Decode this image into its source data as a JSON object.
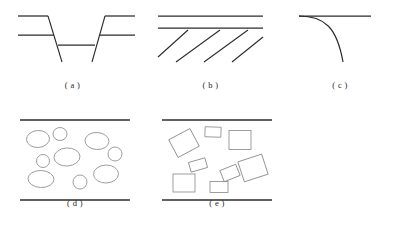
{
  "figure": {
    "width": 399,
    "height": 226,
    "background": "#ffffff",
    "line_color": "#2b2b2b",
    "clast_color": "#8d8d8d"
  },
  "panels": [
    {
      "id": "a",
      "caption": "( a )",
      "name": "graben-normal-fault-panel",
      "description": "Graben bounded by inward-dipping normal faults offsetting two marker beds",
      "beds": [
        {
          "name": "upper-bed-left",
          "x1": 18,
          "y1": 14,
          "x2": 48,
          "y2": 14
        },
        {
          "name": "upper-bed-right",
          "x1": 105,
          "y1": 14,
          "x2": 135,
          "y2": 14
        },
        {
          "name": "middle-bed-left",
          "x1": 18,
          "y1": 33,
          "x2": 54,
          "y2": 33
        },
        {
          "name": "middle-bed-right",
          "x1": 100,
          "y1": 33,
          "x2": 135,
          "y2": 33
        },
        {
          "name": "downthrown-bed",
          "x1": 58,
          "y1": 43,
          "x2": 95,
          "y2": 43
        }
      ],
      "faults": [
        {
          "name": "left-normal-fault",
          "x1": 48,
          "y1": 14,
          "x2": 62,
          "y2": 60
        },
        {
          "name": "right-normal-fault",
          "x1": 105,
          "y1": 14,
          "x2": 92,
          "y2": 60
        }
      ]
    },
    {
      "id": "b",
      "caption": "( b )",
      "name": "parallel-shear-fracture-panel",
      "description": "Two horizontal bedding planes above a set of parallel inclined shear fractures",
      "beds": [
        {
          "name": "upper-bedding-plane",
          "x1": 10,
          "y1": 14,
          "x2": 115,
          "y2": 14
        },
        {
          "name": "lower-bedding-plane",
          "x1": 10,
          "y1": 26,
          "x2": 115,
          "y2": 26
        }
      ],
      "fractures": [
        {
          "name": "shear-fracture-1",
          "x1": 10,
          "y1": 55,
          "x2": 40,
          "y2": 28
        },
        {
          "name": "shear-fracture-2",
          "x1": 28,
          "y1": 60,
          "x2": 72,
          "y2": 28
        },
        {
          "name": "shear-fracture-3",
          "x1": 56,
          "y1": 60,
          "x2": 100,
          "y2": 28
        },
        {
          "name": "shear-fracture-4",
          "x1": 84,
          "y1": 60,
          "x2": 115,
          "y2": 35
        }
      ]
    },
    {
      "id": "c",
      "caption": "( c )",
      "name": "drag-fold-monocline-panel",
      "description": "Horizontal bed bending sharply downward into a drag fold / monocline",
      "beds": [
        {
          "name": "horizontal-bed",
          "x1": 14,
          "y1": 14,
          "x2": 86,
          "y2": 14
        }
      ],
      "fold": {
        "name": "downward-drag-curve",
        "path": "M 14 14 C 40 14, 52 26, 58 60"
      }
    },
    {
      "id": "d",
      "caption": "( d )",
      "name": "rounded-clast-panel",
      "description": "Rounded (elliptical) clasts between upper and lower bed boundaries",
      "boundaries": [
        {
          "name": "upper-boundary",
          "x1": 10,
          "y1": 12,
          "x2": 120,
          "y2": 12
        },
        {
          "name": "lower-boundary",
          "x1": 10,
          "y1": 92,
          "x2": 120,
          "y2": 92
        }
      ],
      "clasts": [
        {
          "name": "clast-1",
          "cx": 28,
          "cy": 31,
          "rx": 11.5,
          "ry": 8.5,
          "rot": -4
        },
        {
          "name": "clast-2",
          "cx": 50,
          "cy": 26,
          "rx": 7.0,
          "ry": 6.5,
          "rot": 0
        },
        {
          "name": "clast-3",
          "cx": 87,
          "cy": 33,
          "rx": 12.0,
          "ry": 8.5,
          "rot": 3
        },
        {
          "name": "clast-4",
          "cx": 105,
          "cy": 46,
          "rx": 7.0,
          "ry": 7.0,
          "rot": 0
        },
        {
          "name": "clast-5",
          "cx": 57,
          "cy": 49,
          "rx": 13.0,
          "ry": 9.0,
          "rot": -3
        },
        {
          "name": "clast-6",
          "cx": 33,
          "cy": 53,
          "rx": 6.5,
          "ry": 6.5,
          "rot": 0
        },
        {
          "name": "clast-7",
          "cx": 31,
          "cy": 71,
          "rx": 13.0,
          "ry": 8.5,
          "rot": 2
        },
        {
          "name": "clast-8",
          "cx": 70,
          "cy": 74,
          "rx": 7.0,
          "ry": 7.0,
          "rot": 0
        },
        {
          "name": "clast-9",
          "cx": 96,
          "cy": 66,
          "rx": 12.5,
          "ry": 9.0,
          "rot": -2
        }
      ]
    },
    {
      "id": "e",
      "caption": "( e )",
      "name": "angular-clast-panel",
      "description": "Angular (rectangular) clasts at varied rotations between bed boundaries",
      "boundaries": [
        {
          "name": "upper-boundary",
          "x1": 10,
          "y1": 12,
          "x2": 120,
          "y2": 12
        },
        {
          "name": "lower-boundary",
          "x1": 10,
          "y1": 92,
          "x2": 120,
          "y2": 92
        }
      ],
      "clasts": [
        {
          "name": "clast-1",
          "cx": 32,
          "cy": 35,
          "w": 24,
          "h": 20,
          "rot": -28
        },
        {
          "name": "clast-2",
          "cx": 61,
          "cy": 24,
          "w": 16,
          "h": 10,
          "rot": 2
        },
        {
          "name": "clast-3",
          "cx": 88,
          "cy": 32,
          "w": 22,
          "h": 19,
          "rot": 0
        },
        {
          "name": "clast-4",
          "cx": 46,
          "cy": 57,
          "w": 17,
          "h": 10,
          "rot": -16
        },
        {
          "name": "clast-5",
          "cx": 78,
          "cy": 65,
          "w": 17,
          "h": 12,
          "rot": -22
        },
        {
          "name": "clast-6",
          "cx": 101,
          "cy": 60,
          "w": 25,
          "h": 21,
          "rot": -18
        },
        {
          "name": "clast-7",
          "cx": 32,
          "cy": 75,
          "w": 22,
          "h": 18,
          "rot": 0
        },
        {
          "name": "clast-8",
          "cx": 67,
          "cy": 79,
          "w": 18,
          "h": 11,
          "rot": 0
        }
      ]
    }
  ]
}
